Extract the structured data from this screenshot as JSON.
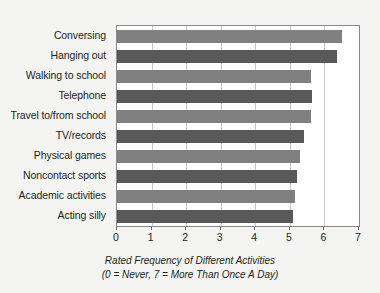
{
  "chart_data": {
    "type": "bar",
    "orientation": "horizontal",
    "title": "",
    "caption_line1": "Rated Frequency of Different Activities",
    "caption_line2": "(0 = Never,  7 = More Than Once A Day)",
    "xlabel": "",
    "ylabel": "",
    "xlim": [
      0,
      7
    ],
    "xticks": [
      0,
      1,
      2,
      3,
      4,
      5,
      6,
      7
    ],
    "xtick_labels": [
      "0",
      "1",
      "2",
      "3",
      "4",
      "5",
      "6",
      "7"
    ],
    "grid": true,
    "legend": "none",
    "categories": [
      "Conversing",
      "Hanging out",
      "Walking to school",
      "Telephone",
      "Travel to/from school",
      "TV/records",
      "Physical games",
      "Noncontact sports",
      "Academic activities",
      "Acting silly"
    ],
    "values": [
      6.5,
      6.35,
      5.6,
      5.65,
      5.6,
      5.4,
      5.3,
      5.2,
      5.15,
      5.1
    ],
    "bar_colors": [
      "#808080",
      "#595959",
      "#808080",
      "#595959",
      "#808080",
      "#595959",
      "#808080",
      "#595959",
      "#808080",
      "#595959"
    ],
    "colors": {
      "background": "#f4f4f2",
      "plot_background": "#ffffff",
      "axis_line": "#8a8a8a",
      "gridline": "#c9c9c9",
      "text": "#231f20",
      "bar_light": "#808080",
      "bar_dark": "#595959"
    }
  }
}
